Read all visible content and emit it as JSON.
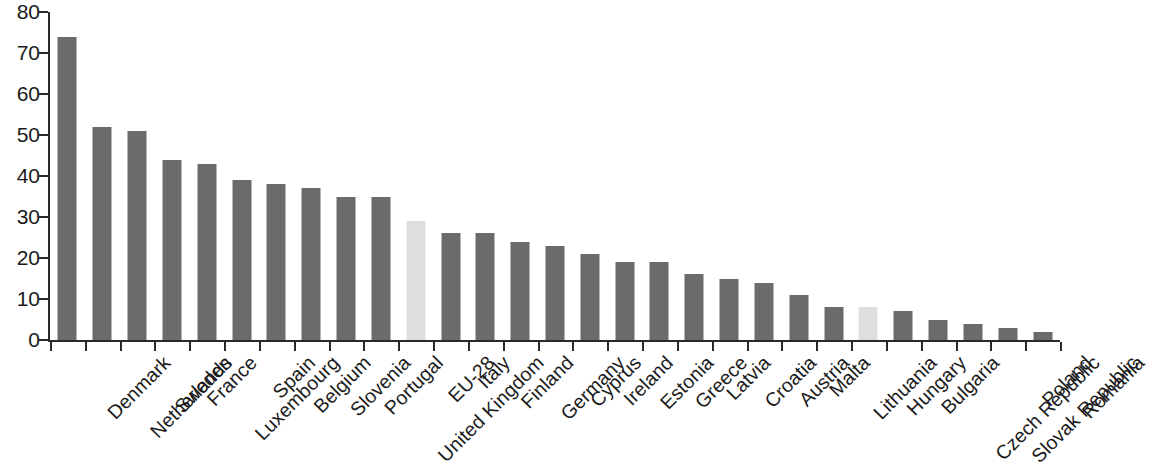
{
  "chart_data": {
    "type": "bar",
    "title": "",
    "subtitle": "",
    "xlabel": "",
    "ylabel": "",
    "ylim": [
      0,
      80
    ],
    "yticks": [
      0,
      10,
      20,
      30,
      40,
      50,
      60,
      70,
      80
    ],
    "grid": false,
    "legend": null,
    "categories": [
      "Denmark",
      "Netherlands",
      "Sweden",
      "France",
      "Luxembourg",
      "Spain",
      "Belgium",
      "Slovenia",
      "Portugal",
      "United Kingdom",
      "EU-28",
      "Italy",
      "Finland",
      "Germany",
      "Cyprus",
      "Ireland",
      "Estonia",
      "Greece",
      "Latvia",
      "Croatia",
      "Austria",
      "Malta",
      "Lithuania",
      "Hungary",
      "Bulgaria",
      "Czech Republic",
      "Slovak Republic",
      "Poland",
      "Romania"
    ],
    "values": [
      74,
      52,
      51,
      44,
      43,
      39,
      38,
      37,
      35,
      35,
      29,
      26,
      26,
      24,
      23,
      21,
      19,
      19,
      16,
      15,
      14,
      11,
      8,
      8,
      7,
      5,
      4,
      3,
      2
    ],
    "highlighted": [
      "EU-28",
      "Hungary"
    ],
    "colors": {
      "bar": "#6b6b6b",
      "bar_highlight": "#dedede",
      "axis": "#2a2a2a",
      "text": "#1b1b1b",
      "background": "#ffffff"
    }
  }
}
